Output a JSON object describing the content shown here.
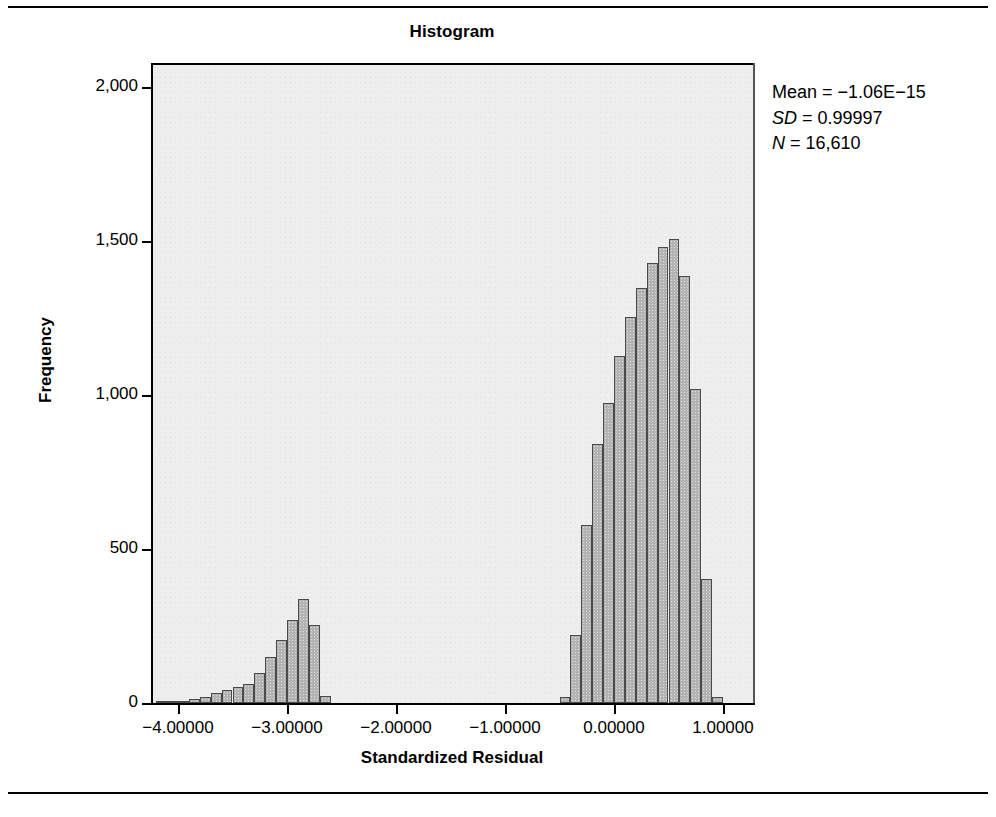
{
  "chart_data": {
    "type": "bar",
    "title": "Histogram",
    "xlabel": "Standardized Residual",
    "ylabel": "Frequency",
    "xlim": [
      -4.45,
      1.4
    ],
    "ylim": [
      0,
      2080
    ],
    "xticks": [
      -4,
      -3,
      -2,
      -1,
      0,
      1
    ],
    "xtick_labels": [
      "−4.00000",
      "−3.00000",
      "−2.00000",
      "−1.00000",
      "0.00000",
      "1.00000"
    ],
    "yticks": [
      0,
      500,
      1000,
      1500,
      2000
    ],
    "ytick_labels": [
      "0",
      "500",
      "1,000",
      "1,500",
      "2,000"
    ],
    "grid": false,
    "legend": null,
    "bin_width": 0.1,
    "bar_color": "#b3b3b3",
    "bar_edge_color": "#4a4a4a",
    "plot_background": "#eeeeee",
    "bins": [
      {
        "x": -4.15,
        "value": 4
      },
      {
        "x": -4.05,
        "value": 4
      },
      {
        "x": -3.95,
        "value": 6
      },
      {
        "x": -3.85,
        "value": 12
      },
      {
        "x": -3.75,
        "value": 20
      },
      {
        "x": -3.65,
        "value": 34
      },
      {
        "x": -3.55,
        "value": 42
      },
      {
        "x": -3.45,
        "value": 52
      },
      {
        "x": -3.35,
        "value": 62
      },
      {
        "x": -3.25,
        "value": 96
      },
      {
        "x": -3.15,
        "value": 150
      },
      {
        "x": -3.05,
        "value": 205
      },
      {
        "x": -2.95,
        "value": 270
      },
      {
        "x": -2.85,
        "value": 338
      },
      {
        "x": -2.75,
        "value": 252
      },
      {
        "x": -2.65,
        "value": 22
      },
      {
        "x": -0.45,
        "value": 18
      },
      {
        "x": -0.35,
        "value": 222
      },
      {
        "x": -0.25,
        "value": 578
      },
      {
        "x": -0.15,
        "value": 840
      },
      {
        "x": -0.05,
        "value": 975
      },
      {
        "x": 0.05,
        "value": 1128
      },
      {
        "x": 0.15,
        "value": 1252
      },
      {
        "x": 0.25,
        "value": 1348
      },
      {
        "x": 0.35,
        "value": 1430
      },
      {
        "x": 0.45,
        "value": 1482
      },
      {
        "x": 0.55,
        "value": 1505
      },
      {
        "x": 0.65,
        "value": 1385
      },
      {
        "x": 0.75,
        "value": 1020
      },
      {
        "x": 0.85,
        "value": 402
      },
      {
        "x": 0.95,
        "value": 18
      }
    ],
    "annotations": {
      "mean_label": "Mean",
      "mean_value": "−1.06E−15",
      "sd_label": "SD",
      "sd_value": "0.99997",
      "n_label": "N",
      "n_value": "16,610",
      "equals": "=",
      "position": "top-right"
    }
  }
}
